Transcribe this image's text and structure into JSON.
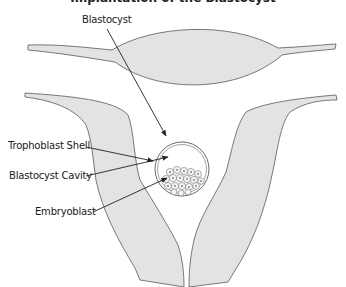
{
  "diagram": {
    "title_partial": "Implantation of the Blastocyst",
    "labels": {
      "blastocyst": "Blastocyst",
      "trophoblast_shell": "Trophoblast Shell",
      "blastocyst_cavity": "Blastocyst Cavity",
      "embryoblast": "Embryoblast"
    },
    "colors": {
      "tissue_fill": "#e3e3e3",
      "outline": "#6a6a6a",
      "arrow": "#222222",
      "cell_fill": "#f4f4f4"
    },
    "components": [
      "upper-uterine-lens",
      "left-uterine-wall",
      "right-uterine-wall",
      "blastocyst-sphere",
      "embryoblast-cell-cluster"
    ]
  }
}
